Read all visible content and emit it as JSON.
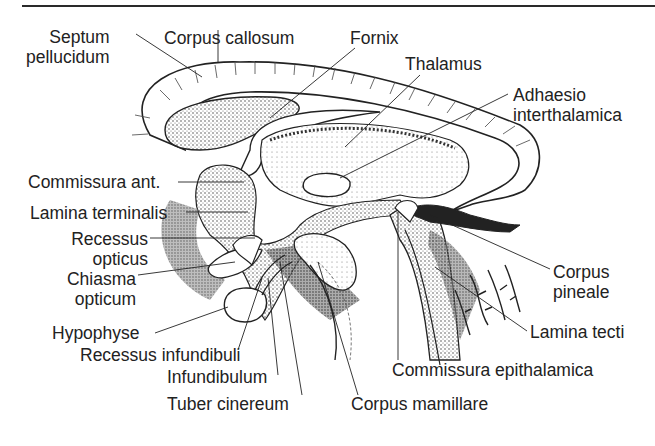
{
  "figure": {
    "labels": {
      "septum_pellucidum": [
        "Septum",
        "pellucidum"
      ],
      "corpus_callosum": "Corpus callosum",
      "fornix": "Fornix",
      "thalamus": "Thalamus",
      "adhaesio_interthalamica": [
        "Adhaesio",
        "interthalamica"
      ],
      "commissura_ant": "Commissura ant.",
      "lamina_terminalis": "Lamina terminalis",
      "recessus_opticus": [
        "Recessus",
        "opticus"
      ],
      "chiasma_opticum": [
        "Chiasma",
        "opticum"
      ],
      "hypophyse": "Hypophyse",
      "recessus_infundibuli": "Recessus infundibuli",
      "infundibulum": "Infundibulum",
      "tuber_cinereum": "Tuber cinereum",
      "corpus_mamillare": "Corpus mamillare",
      "commissura_epithalamica": "Commissura epithalamica",
      "lamina_tecti": "Lamina tecti",
      "corpus_pineale": [
        "Corpus",
        "pineale"
      ]
    },
    "colors": {
      "ink": "#231f20",
      "background": "#ffffff"
    }
  }
}
